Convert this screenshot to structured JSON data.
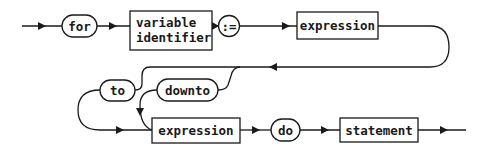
{
  "diagram": {
    "type": "syntax-diagram",
    "nodes": {
      "for": {
        "label": "for",
        "kind": "terminal"
      },
      "variable_identifier": {
        "line1": "variable",
        "line2": "identifier",
        "kind": "nonterminal"
      },
      "assign": {
        "label": ":=",
        "kind": "terminal"
      },
      "expression1": {
        "label": "expression",
        "kind": "nonterminal"
      },
      "to": {
        "label": "to",
        "kind": "terminal"
      },
      "downto": {
        "label": "downto",
        "kind": "terminal"
      },
      "expression2": {
        "label": "expression",
        "kind": "nonterminal"
      },
      "do": {
        "label": "do",
        "kind": "terminal"
      },
      "statement": {
        "label": "statement",
        "kind": "nonterminal"
      }
    },
    "sequence": [
      "for",
      "variable identifier",
      ":=",
      "expression",
      "to | downto",
      "expression",
      "do",
      "statement"
    ],
    "colors": {
      "ink": "#1a1a1a",
      "background": "#ffffff"
    }
  }
}
